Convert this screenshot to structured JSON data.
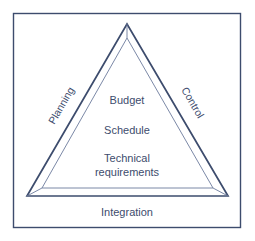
{
  "figure": {
    "name": "project-management-triangle",
    "background_color": "#ffffff",
    "line_color": "#3d4c6d",
    "inner_line_color": "#6c7a9c",
    "text_color": "#3d4c6d",
    "frame": {
      "x": 13,
      "y": 13,
      "width": 228,
      "height": 215
    },
    "outer_triangle": {
      "apex": [
        127,
        24
      ],
      "left": [
        27,
        196
      ],
      "right": [
        228,
        196
      ]
    },
    "inner_triangle": {
      "apex": [
        127,
        38
      ],
      "left": [
        42,
        188
      ],
      "right": [
        213,
        188
      ]
    }
  },
  "inner_labels": [
    {
      "text": "Budget",
      "x": 127,
      "y": 101
    },
    {
      "text": "Schedule",
      "x": 127,
      "y": 131
    },
    {
      "text": "Technical",
      "x": 127,
      "y": 159
    },
    {
      "text": "requirements",
      "x": 127,
      "y": 173
    }
  ],
  "edge_labels": [
    {
      "text": "Planning",
      "x": 62,
      "y": 106,
      "rotation": -60
    },
    {
      "text": "Control",
      "x": 192,
      "y": 103,
      "rotation": 60
    }
  ],
  "bottom_label": {
    "text": "Integration",
    "x": 127,
    "y": 213
  }
}
